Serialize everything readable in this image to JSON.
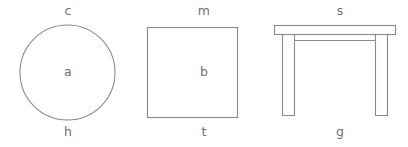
{
  "canvas": {
    "background_color": "#ffffff",
    "stroke_color": "#8a8a8a",
    "text_color": "#6f6f6f"
  },
  "figures": [
    {
      "shape": "circle",
      "label_top": "c",
      "label_center": "a",
      "label_bottom": "h"
    },
    {
      "shape": "square",
      "label_top": "m",
      "label_center": "b",
      "label_bottom": "t"
    },
    {
      "shape": "table",
      "label_top": "s",
      "label_center": "",
      "label_bottom": "g"
    }
  ]
}
